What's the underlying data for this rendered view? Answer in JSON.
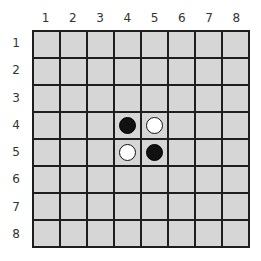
{
  "board": {
    "size": 8,
    "column_labels": [
      "1",
      "2",
      "3",
      "4",
      "5",
      "6",
      "7",
      "8"
    ],
    "row_labels": [
      "1",
      "2",
      "3",
      "4",
      "5",
      "6",
      "7",
      "8"
    ],
    "cell_color": "#d6d6d6",
    "grid_line_color": "#1e1e1e",
    "pieces": [
      {
        "row": 4,
        "col": 4,
        "color": "black"
      },
      {
        "row": 4,
        "col": 5,
        "color": "white"
      },
      {
        "row": 5,
        "col": 4,
        "color": "white"
      },
      {
        "row": 5,
        "col": 5,
        "color": "black"
      }
    ]
  }
}
